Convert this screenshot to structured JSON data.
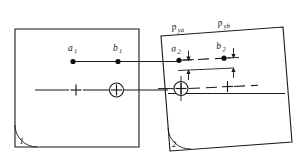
{
  "figure": {
    "type": "technical-diagram",
    "background_color": "#ffffff",
    "line_color": "#1a1a1a"
  },
  "panels": [
    {
      "id": "panel-1",
      "number_label": "1",
      "rotation_deg": 0,
      "corner_arc": true
    },
    {
      "id": "panel-2",
      "number_label": "2",
      "rotation_deg": -4,
      "corner_arc": true
    }
  ],
  "points": {
    "a1": {
      "label": "a",
      "subscript": "1"
    },
    "b1": {
      "label": "b",
      "subscript": "1"
    },
    "a2": {
      "label": "a",
      "subscript": "2"
    },
    "b2": {
      "label": "b",
      "subscript": "2"
    }
  },
  "dimensions": {
    "pya": {
      "label": "p",
      "subscript": "ya"
    },
    "pyb": {
      "label": "p",
      "subscript": "yb"
    }
  },
  "markers": {
    "circled_plus_left": "circled-plus-fiducial",
    "circled_plus_right": "circled-plus-fiducial",
    "plain_plus_left": "plus-fiducial",
    "plain_plus_right": "plus-fiducial"
  },
  "reference_lines": {
    "upper": "point-row-reference-line",
    "lower": "fiducial-reference-line"
  }
}
